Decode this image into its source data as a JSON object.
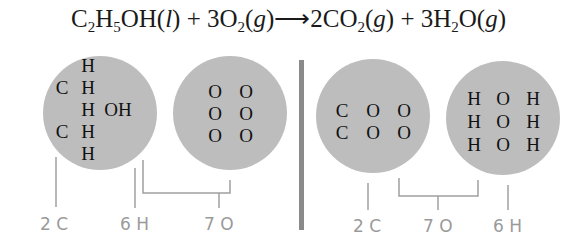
{
  "equation": {
    "parts": [
      {
        "t": "C"
      },
      {
        "sub": "2"
      },
      {
        "t": "H"
      },
      {
        "sub": "5"
      },
      {
        "t": "OH("
      },
      {
        "i": "l"
      },
      {
        "t": ") + 3O"
      },
      {
        "sub": "2"
      },
      {
        "t": "("
      },
      {
        "i": "g"
      },
      {
        "t": ")⟶2CO"
      },
      {
        "sub": "2"
      },
      {
        "t": "("
      },
      {
        "i": "g"
      },
      {
        "t": ") + 3H"
      },
      {
        "sub": "2"
      },
      {
        "t": "O("
      },
      {
        "i": "g"
      },
      {
        "t": ")"
      }
    ]
  },
  "circles": [
    {
      "name": "ethanol-circle",
      "rows": [
        [
          "",
          "H",
          ""
        ],
        [
          "C",
          "H",
          ""
        ],
        [
          "",
          "H",
          "OH"
        ],
        [
          "C",
          "H",
          ""
        ],
        [
          "",
          "H",
          ""
        ]
      ]
    },
    {
      "name": "oxygen-circle",
      "rows": [
        [
          "O",
          "O"
        ],
        [
          "O",
          "O"
        ],
        [
          "O",
          "O"
        ]
      ]
    },
    {
      "name": "carbon-dioxide-circle",
      "rows": [
        [
          "C",
          "O",
          "O"
        ],
        [
          "C",
          "O",
          "O"
        ]
      ]
    },
    {
      "name": "water-circle",
      "rows": [
        [
          "H",
          "O",
          "H"
        ],
        [
          "H",
          "O",
          "H"
        ],
        [
          "H",
          "O",
          "H"
        ]
      ]
    }
  ],
  "labels": {
    "left": {
      "carbon": "2 C",
      "hydrogen": "6 H",
      "oxygen": "7 O"
    },
    "right": {
      "carbon": "2 C",
      "oxygen": "7 O",
      "hydrogen": "6 H"
    }
  },
  "colors": {
    "circle_fill": "#bdbdbd",
    "divider": "#8a8a8a",
    "label": "#9a9a9a",
    "bracket": "#a0a0a0"
  }
}
